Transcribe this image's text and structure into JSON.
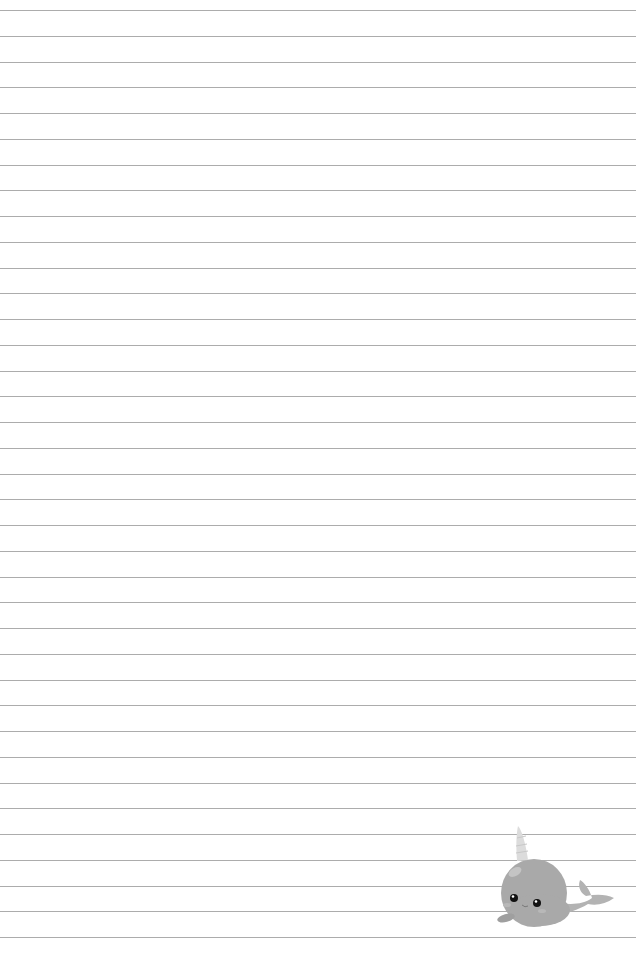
{
  "document": {
    "type": "lined-paper",
    "background_color": "#ffffff",
    "line_color": "#9e9e9e",
    "line_count": 37,
    "first_line_y": 10,
    "line_spacing": 25.75
  },
  "illustration": {
    "subject": "narwhal",
    "position": "bottom-right",
    "body_color": "#a9a9a9",
    "horn_color": "#dcdcdc",
    "eye_color": "#111111"
  }
}
